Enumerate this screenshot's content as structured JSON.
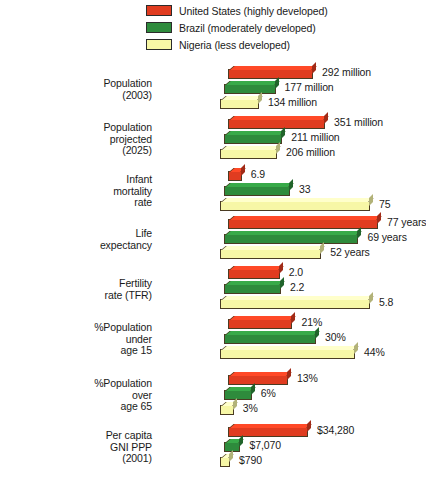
{
  "legend": {
    "items": [
      {
        "label": "United States (highly developed)",
        "color": "#E03C20",
        "name": "legend-united-states"
      },
      {
        "label": "Brazil (moderately developed)",
        "color": "#2E8B3C",
        "name": "legend-brazil"
      },
      {
        "label": "Nigeria (less developed)",
        "color": "#F7F7A6",
        "name": "legend-nigeria"
      }
    ]
  },
  "chart_data": {
    "type": "bar",
    "orientation": "horizontal",
    "title": "",
    "xlabel": "",
    "ylabel": "",
    "grid": false,
    "legend_position": "top-right",
    "series": [
      {
        "name": "United States (highly developed)",
        "color": "#E03C20"
      },
      {
        "name": "Brazil (moderately developed)",
        "color": "#2E8B3C"
      },
      {
        "name": "Nigeria (less developed)",
        "color": "#F7F7A6"
      }
    ],
    "categories": [
      "Population (2003)",
      "Population projected (2025)",
      "Infant mortality rate",
      "Life expectancy",
      "Fertility rate (TFR)",
      "%Population under age 15",
      "%Population over age 65",
      "Per capita GNI PPP (2001)"
    ],
    "groups": [
      {
        "label_lines": [
          "Population",
          "(2003)"
        ],
        "unit": "million",
        "values": [
          292,
          177,
          134
        ],
        "labels": [
          "292 million",
          "177 million",
          "134 million"
        ],
        "max_scale": 292
      },
      {
        "label_lines": [
          "Population",
          "projected",
          "(2025)"
        ],
        "unit": "million",
        "values": [
          351,
          211,
          206
        ],
        "labels": [
          "351 million",
          "211 million",
          "206 million"
        ],
        "max_scale": 351
      },
      {
        "label_lines": [
          "Infant",
          "mortality",
          "rate"
        ],
        "unit": "per 1,000",
        "values": [
          6.9,
          33,
          75
        ],
        "labels": [
          "6.9",
          "33",
          "75"
        ],
        "max_scale": 75
      },
      {
        "label_lines": [
          "Life",
          "expectancy"
        ],
        "unit": "years",
        "values": [
          77,
          69,
          52
        ],
        "labels": [
          "77 years",
          "69 years",
          "52 years"
        ],
        "max_scale": 77
      },
      {
        "label_lines": [
          "Fertility",
          "rate (TFR)"
        ],
        "unit": "children per woman",
        "values": [
          2.0,
          2.2,
          5.8
        ],
        "labels": [
          "2.0",
          "2.2",
          "5.8"
        ],
        "max_scale": 5.8
      },
      {
        "label_lines": [
          "%Population",
          "under",
          "age 15"
        ],
        "unit": "%",
        "values": [
          21,
          30,
          44
        ],
        "labels": [
          "21%",
          "30%",
          "44%"
        ],
        "max_scale": 44
      },
      {
        "label_lines": [
          "%Population",
          "over",
          "age 65"
        ],
        "unit": "%",
        "values": [
          13,
          6,
          3
        ],
        "labels": [
          "13%",
          "6%",
          "3%"
        ],
        "max_scale": 13
      },
      {
        "label_lines": [
          "Per capita",
          "GNI PPP",
          "(2001)"
        ],
        "unit": "US$",
        "values": [
          34280,
          7070,
          790
        ],
        "labels": [
          "$34,280",
          "$7,070",
          "$790"
        ],
        "max_scale": 34280
      }
    ]
  },
  "layout": {
    "group_tops": [
      66,
      116,
      168,
      216,
      266,
      316,
      372,
      424
    ],
    "group_max_width": [
      85,
      97,
      150,
      150,
      150,
      135,
      60,
      80
    ],
    "bar_origin_x": 228,
    "row_pitch": 15,
    "stagger_x": -4
  }
}
